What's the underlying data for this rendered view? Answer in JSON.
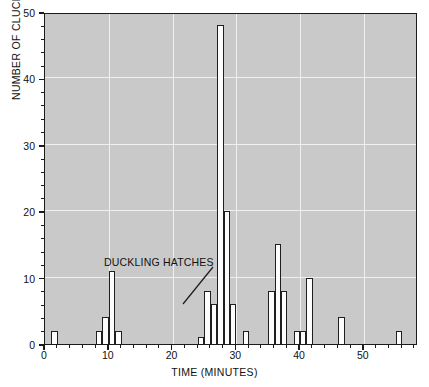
{
  "chart_data": {
    "type": "bar",
    "title": "",
    "subtitle": "",
    "xlabel": "TIME (MINUTES)",
    "ylabel": "NUMBER OF CLUCKS",
    "xlim": [
      0,
      58.5
    ],
    "ylim": [
      0,
      50
    ],
    "xticks": [
      0,
      10,
      20,
      30,
      40,
      50
    ],
    "xtick_labels": [
      "0",
      "10",
      "20",
      "30",
      "40",
      "50"
    ],
    "yticks": [
      0,
      10,
      20,
      30,
      40,
      50
    ],
    "ytick_labels": [
      "0",
      "10",
      "20",
      "30",
      "40",
      "50"
    ],
    "x_minor_tick_interval": 2,
    "y_minor_tick_interval": 2,
    "grid": true,
    "grid_color": "#f0f0f0",
    "plot_background": "#c9c9c9",
    "bar_fill": "#fdfdfd",
    "bar_edge": "#1f1f1f",
    "bar_width_minutes": 1,
    "legend": null,
    "categories": [
      1,
      8,
      9,
      10,
      11,
      24,
      25,
      26,
      27,
      28,
      29,
      31,
      35,
      36,
      37,
      39,
      40,
      41,
      46,
      55
    ],
    "values": [
      2,
      2,
      4,
      11,
      2,
      1,
      8,
      6,
      48,
      20,
      6,
      2,
      8,
      15,
      8,
      2,
      2,
      10,
      4,
      2
    ],
    "annotations": [
      {
        "text": "DUCKLING HATCHES",
        "points_to_x": 25,
        "points_to_y": 8,
        "label_x": 9.5,
        "label_y": 13.5
      }
    ]
  }
}
